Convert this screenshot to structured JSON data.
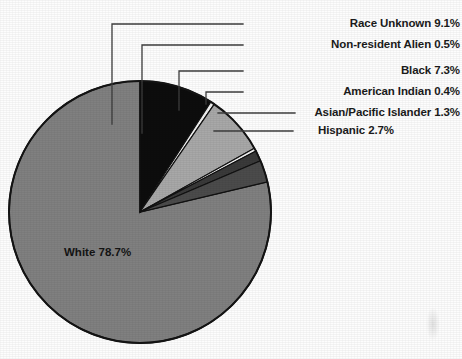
{
  "chart_data": {
    "type": "pie",
    "title": "",
    "subtitle": "",
    "xlabel": "",
    "ylabel": "",
    "legend_position": "callout-labels",
    "grid": false,
    "units": "percent",
    "start_angle_deg": 0,
    "direction": "clockwise",
    "categories": [
      "White",
      "Race Unknown",
      "Non-resident Alien",
      "Black",
      "American Indian",
      "Asian/Pacific Islander",
      "Hispanic"
    ],
    "values": [
      78.7,
      9.1,
      0.5,
      7.3,
      0.4,
      1.3,
      2.7
    ],
    "slices": [
      {
        "name": "Race Unknown",
        "value": 9.1,
        "label": "Race Unknown 9.1%",
        "color": "#0d0d0d"
      },
      {
        "name": "Non-resident Alien",
        "value": 0.5,
        "label": "Non-resident Alien 0.5%",
        "color": "#f2f2f2"
      },
      {
        "name": "Black",
        "value": 7.3,
        "label": "Black 7.3%",
        "color": "#a8a8a8"
      },
      {
        "name": "American Indian",
        "value": 0.4,
        "label": "American Indian 0.4%",
        "color": "#f2f2f2"
      },
      {
        "name": "Asian/Pacific Islander",
        "value": 1.3,
        "label": "Asian/Pacific Islander 1.3%",
        "color": "#3a3a3a"
      },
      {
        "name": "Hispanic",
        "value": 2.7,
        "label": "Hispanic 2.7%",
        "color": "#4b4b4b"
      },
      {
        "name": "White",
        "value": 78.7,
        "label": "White 78.7%",
        "color": "#808080"
      }
    ],
    "annotations": {
      "inside_label": "White 78.7%"
    }
  },
  "labels": {
    "race_unknown": "Race Unknown 9.1%",
    "non_resident_alien": "Non-resident Alien 0.5%",
    "black": "Black 7.3%",
    "american_indian": "American Indian 0.4%",
    "asian_pacific_islander": "Asian/Pacific Islander 1.3%",
    "hispanic": "Hispanic 2.7%",
    "white_inside": "White 78.7%"
  },
  "colors": {
    "white_slice": "#808080",
    "race_unknown_slice": "#0d0d0d",
    "black_slice": "#a8a8a8",
    "hispanic_slice": "#4b4b4b",
    "asian_slice": "#3a3a3a",
    "thin_slice": "#f2f2f2",
    "outline": "#111111",
    "text": "#1b1b1b",
    "background": "#fdfdfd"
  }
}
